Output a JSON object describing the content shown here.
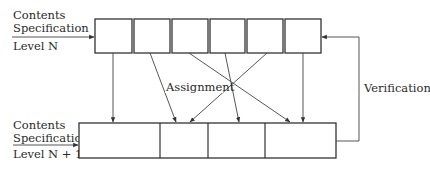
{
  "diagram": {
    "type": "hierarchical specification assignment diagram",
    "colors": {
      "stroke": "#333333",
      "text": "#2a2a2a",
      "background": "#ffffff"
    },
    "levels": {
      "top": {
        "label_line1": "Contents",
        "label_line2": "Specification",
        "level": "Level N",
        "cell_count": 6
      },
      "bottom": {
        "label_line1": "Contents",
        "label_line2": "Specification",
        "level": "Level N + 1",
        "cell_count": 4
      }
    },
    "labels": {
      "assignment": "Assignment",
      "verification": "Verification"
    }
  }
}
